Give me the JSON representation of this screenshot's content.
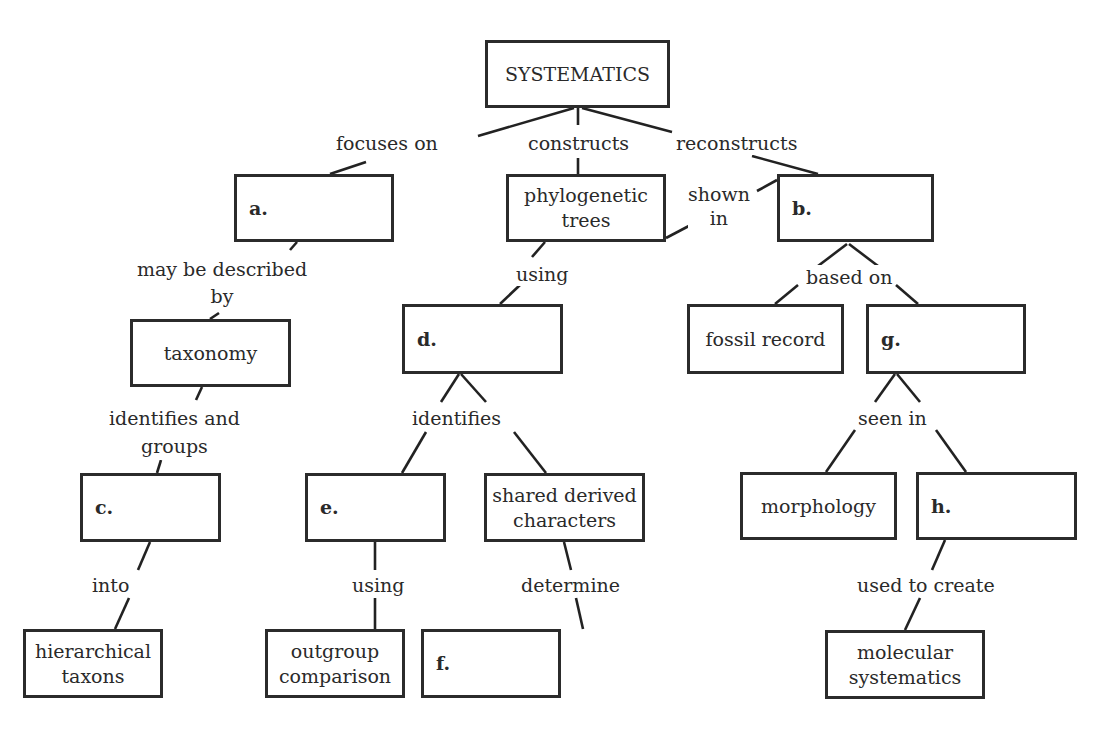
{
  "nodes": {
    "root": "SYSTEMATICS",
    "a": "a.",
    "phylo_line1": "phylogenetic",
    "phylo_line2": "trees",
    "b": "b.",
    "taxonomy": "taxonomy",
    "d": "d.",
    "fossil": "fossil record",
    "g": "g.",
    "c": "c.",
    "e": "e.",
    "shared_line1": "shared derived",
    "shared_line2": "characters",
    "morphology": "morphology",
    "h": "h.",
    "hier_line1": "hierarchical",
    "hier_line2": "taxons",
    "outgroup_line1": "outgroup",
    "outgroup_line2": "comparison",
    "f": "f.",
    "molec_line1": "molecular",
    "molec_line2": "systematics"
  },
  "links": {
    "focuses_on": "focuses on",
    "constructs": "constructs",
    "reconstructs": "reconstructs",
    "shown_line1": "shown",
    "shown_line2": "in",
    "may_line1": "may be described",
    "may_line2": "by",
    "using_top": "using",
    "based_on": "based on",
    "ident_groups_line1": "identifies and",
    "ident_groups_line2": "groups",
    "identifies": "identifies",
    "seen_in": "seen in",
    "into": "into",
    "using_bottom": "using",
    "determine": "determine",
    "used_to_create": "used to create"
  }
}
